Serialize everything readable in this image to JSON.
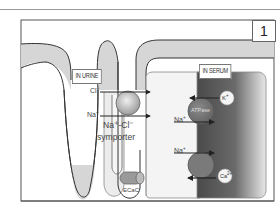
{
  "figure": {
    "panel_number": "1",
    "regions": {
      "urine_label": "IN URINE",
      "serum_label": "IN SERUM"
    },
    "ions": {
      "cl": "Cl",
      "cl_charge": "−",
      "na_left": "Na",
      "na_left_charge": "+",
      "na_mid": "Na",
      "na_mid_charge": "+",
      "na_lower": "Na",
      "na_lower_charge": "+",
      "k": "K",
      "k_charge": "+",
      "ca": "Ca",
      "ca_charge": "2+"
    },
    "transporters": {
      "symporter_line1": "Na⁺-Cl⁻",
      "symporter_line2": "symporter",
      "atpase": "ATPase",
      "channel": "ECaC"
    },
    "colors": {
      "tubule_fill": "#d6d6d6",
      "outline": "#3a3a3a",
      "cell_fill": "#f4f4f4",
      "serum_dark": "#5a5a5a",
      "serum_light": "#e6e6e6",
      "transporter_gray": "#7a7a7a"
    }
  }
}
